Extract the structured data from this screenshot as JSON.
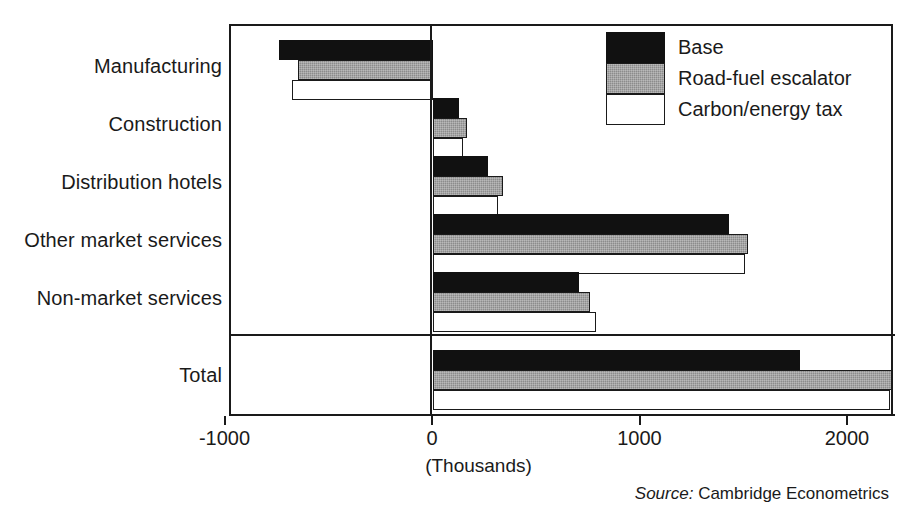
{
  "chart_data": {
    "type": "bar",
    "orientation": "horizontal",
    "title": "",
    "xlabel": "(Thousands)",
    "ylabel": "",
    "xlim": [
      -1000,
      2200
    ],
    "xticks": [
      -1000,
      0,
      1000,
      2000
    ],
    "xtick_labels": [
      "-1000",
      "0",
      "1000",
      "2000"
    ],
    "grid": false,
    "legend_position": "top-right",
    "categories": [
      "Manufacturing",
      "Construction",
      "Distribution hotels",
      "Other market services",
      "Non-market services",
      "Total"
    ],
    "series": [
      {
        "name": "Base",
        "color": "#111111",
        "values": [
          -740,
          125,
          265,
          1425,
          705,
          1770
        ]
      },
      {
        "name": "Road-fuel escalator",
        "color": "#8c8c8c",
        "values": [
          -650,
          165,
          335,
          1520,
          755,
          2210
        ]
      },
      {
        "name": "Carbon/energy tax",
        "color": "#ffffff",
        "values": [
          -680,
          145,
          315,
          1505,
          785,
          2200
        ]
      }
    ],
    "annotations": {
      "source_label": "Source:",
      "source_value": "Cambridge Econometrics"
    }
  },
  "legend": {
    "items": [
      {
        "label": "Base",
        "swatch": "black-swatch"
      },
      {
        "label": "Road-fuel escalator",
        "swatch": "gray-swatch"
      },
      {
        "label": "Carbon/energy tax",
        "swatch": "white-swatch"
      }
    ]
  },
  "axis": {
    "unit_label": "(Thousands)",
    "tick_labels": [
      "-1000",
      "0",
      "1000",
      "2000"
    ]
  },
  "source": {
    "label": "Source:",
    "value": "Cambridge Econometrics"
  }
}
